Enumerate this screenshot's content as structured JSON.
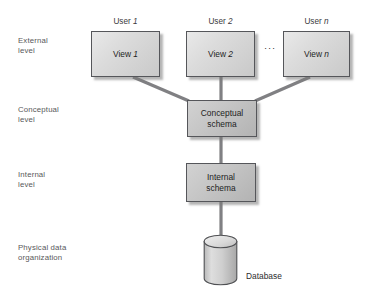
{
  "diagram": {
    "background_color": "#ffffff",
    "line_color": "#808083",
    "box_border_color": "#55565a",
    "label_color": "#58585a"
  },
  "levels": [
    {
      "id": "external",
      "label": "External\nlevel"
    },
    {
      "id": "conceptual",
      "label": "Conceptual\nlevel"
    },
    {
      "id": "internal",
      "label": "Internal\nlevel"
    },
    {
      "id": "physical",
      "label": "Physical data\norganization"
    }
  ],
  "users": [
    {
      "prefix": "User ",
      "index": "1"
    },
    {
      "prefix": "User ",
      "index": "2"
    },
    {
      "prefix": "User ",
      "index": "n"
    }
  ],
  "views": [
    {
      "prefix": "View ",
      "index": "1"
    },
    {
      "prefix": "View ",
      "index": "2"
    },
    {
      "prefix": "View ",
      "index": "n"
    }
  ],
  "ellipsis": "···",
  "schemas": {
    "conceptual": "Conceptual\nschema",
    "internal": "Internal\nschema"
  },
  "storage": {
    "label": "Database",
    "shape": "cylinder-icon"
  }
}
